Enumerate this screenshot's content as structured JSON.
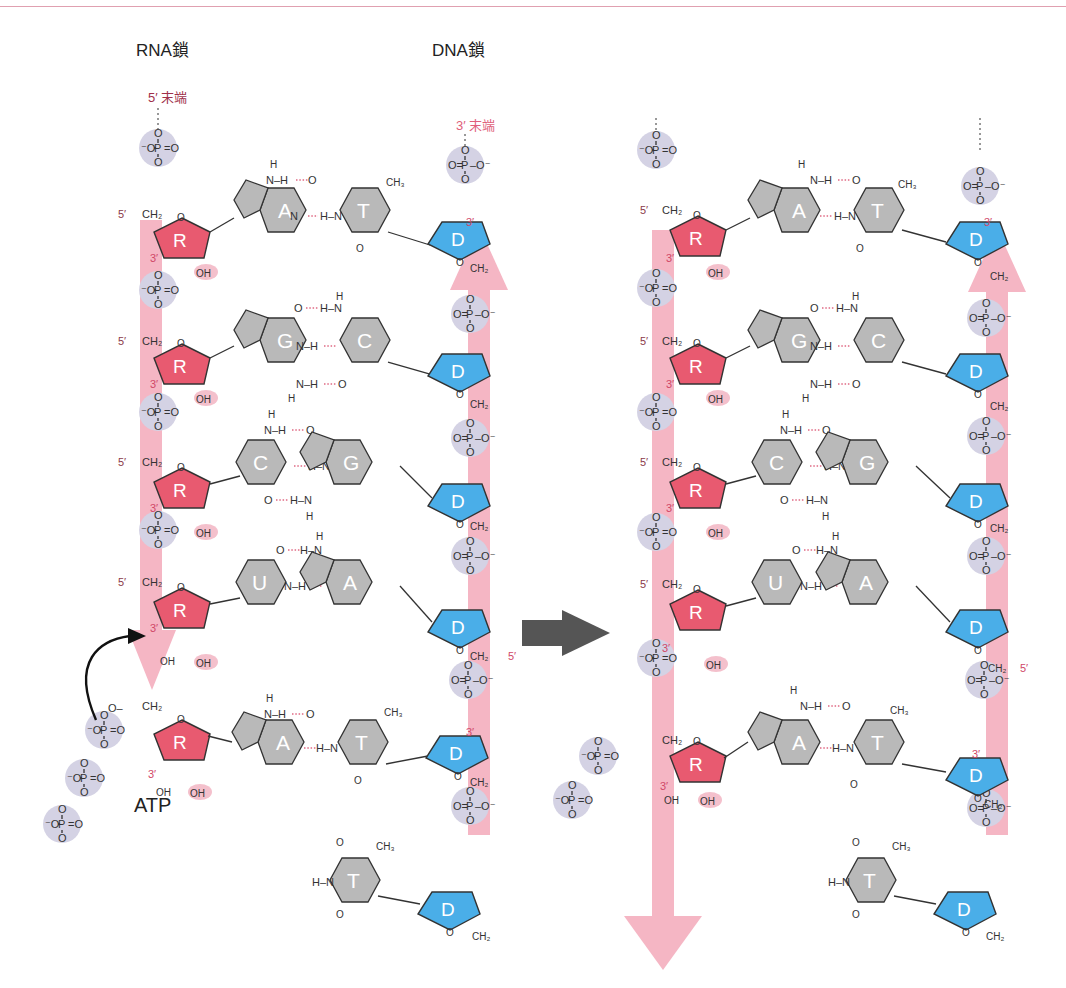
{
  "figure": {
    "topic": "RNA transcription: ribonucleotide addition on DNA template",
    "colors": {
      "ribose": "#e85a70",
      "deoxyribose": "#4aaee8",
      "base": "#b8b8b8",
      "phosphate": "#cfcde0",
      "strand_arrow": "#f5b6c4",
      "hbond": "#e06a84",
      "process_arrow": "#555555",
      "top_rule": "#e0a0b0"
    }
  },
  "labels": {
    "rna_strand": "RNA鎖",
    "dna_strand": "DNA鎖",
    "rna_5_end": "5′ 末端",
    "dna_3_end": "3′ 末端",
    "atp": "ATP",
    "five_prime": "5′",
    "three_prime": "3′",
    "ch2": "CH₂",
    "oh": "OH",
    "ribose": "R",
    "deoxyribose": "D",
    "phosphate_center": "P",
    "ch3": "CH₃"
  },
  "panels": [
    {
      "name": "before",
      "rna_sugars": [
        "R",
        "R",
        "R",
        "R",
        "R"
      ],
      "base_pairs": [
        {
          "rna": "A",
          "dna": "T"
        },
        {
          "rna": "G",
          "dna": "C"
        },
        {
          "rna": "C",
          "dna": "G"
        },
        {
          "rna": "U",
          "dna": "A"
        },
        {
          "rna": "A",
          "dna": "T",
          "note": "incoming ATP"
        }
      ],
      "unpaired_dna_base": "T"
    },
    {
      "name": "after",
      "rna_sugars": [
        "R",
        "R",
        "R",
        "R",
        "R"
      ],
      "base_pairs": [
        {
          "rna": "A",
          "dna": "T"
        },
        {
          "rna": "G",
          "dna": "C"
        },
        {
          "rna": "C",
          "dna": "G"
        },
        {
          "rna": "U",
          "dna": "A"
        },
        {
          "rna": "A",
          "dna": "T",
          "note": "incorporated"
        }
      ],
      "unpaired_dna_base": "T",
      "released": "pyrophosphate"
    }
  ]
}
